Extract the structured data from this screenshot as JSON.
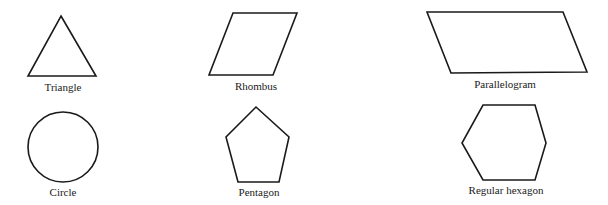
{
  "figure": {
    "stroke_color": "#1a1a1a",
    "background": "#ffffff",
    "shapes": [
      {
        "name": "triangle",
        "label": "Triangle",
        "points": "61,16 96,76 28,76",
        "label_x": 63,
        "label_y": 82
      },
      {
        "name": "rhombus",
        "label": "Rhombus",
        "points": "233,13 297,13 273,75 209,75",
        "label_x": 256,
        "label_y": 81
      },
      {
        "name": "parallelogram",
        "label": "Parallelogram",
        "points": "427,12 563,12 587,72 451,73",
        "label_x": 505,
        "label_y": 79
      },
      {
        "name": "circle",
        "label": "Circle",
        "cx": 63,
        "cy": 147,
        "r": 35,
        "label_x": 63,
        "label_y": 187
      },
      {
        "name": "pentagon",
        "label": "Pentagon",
        "points": "256,107 289,137 279,182 238,182 226,137",
        "label_x": 259,
        "label_y": 187
      },
      {
        "name": "regular-hexagon",
        "label": "Regular hexagon",
        "points": "483,105 535,105 546,143 535,180 483,180 462,143",
        "label_x": 506,
        "label_y": 185
      }
    ]
  }
}
